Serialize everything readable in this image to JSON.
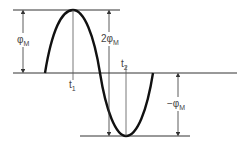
{
  "diagram": {
    "type": "sine-wave-flux",
    "labels": {
      "phi_m": "φ",
      "phi_m_sub": "M",
      "two_phi_m": "2φ",
      "two_phi_m_sub": "M",
      "neg_phi_m": "−φ",
      "neg_phi_m_sub": "M",
      "t1": "t",
      "t1_sub": "1",
      "t2": "t",
      "t2_sub": "2"
    },
    "colors": {
      "curve": "#111111",
      "lines": "#333333",
      "text": "#444444"
    }
  }
}
